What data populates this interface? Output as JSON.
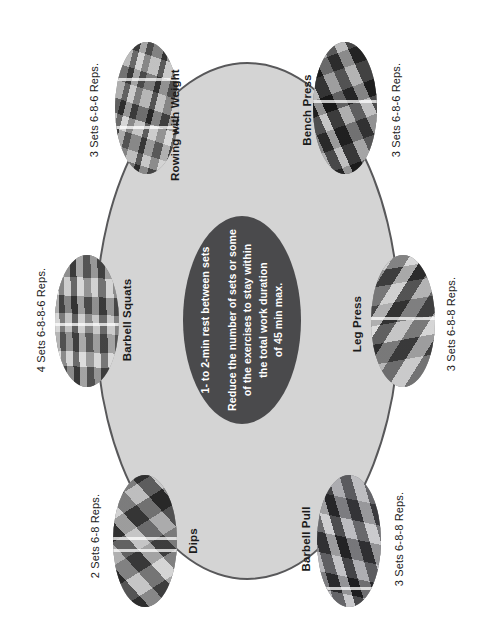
{
  "diagram": {
    "type": "circuit-training-wheel",
    "orientation": "rotated-90-ccw",
    "colors": {
      "outer_ellipse_fill": "#d4d4d4",
      "outer_ellipse_stroke": "#58585a",
      "center_ellipse_fill": "#4a4a4c",
      "center_text": "#ffffff",
      "label_text": "#1b1b1b",
      "page_background": "#ffffff"
    }
  },
  "center_note": {
    "paragraphs": [
      "1- to 2-min rest between sets",
      "Reduce the number of sets or some of the exercises to stay within the total work duration of 45 min max."
    ],
    "line1": "1- to 2-min rest between sets",
    "line2": "Reduce the number of sets or some",
    "line3": "of the exercises to stay within",
    "line4": "the total work duration",
    "line5": "of 45 min max."
  },
  "exercises": [
    {
      "id": "rowing-with-weight",
      "name": "Rowing with Weight",
      "reps": "3 Sets 6-8-6 Reps.",
      "position": "top-left"
    },
    {
      "id": "bench-press",
      "name": "Bench Press",
      "reps": "3 Sets 6-8-6 Reps.",
      "position": "top-right"
    },
    {
      "id": "barbell-squats",
      "name": "Barbell Squats",
      "reps": "4 Sets 6-8-8-6 Reps.",
      "position": "middle-left"
    },
    {
      "id": "leg-press",
      "name": "Leg Press",
      "reps": "3 Sets 6-8-8 Reps.",
      "position": "middle-right"
    },
    {
      "id": "dips",
      "name": "Dips",
      "reps": "2 Sets 6-8 Reps.",
      "position": "bottom-left"
    },
    {
      "id": "barbell-pull",
      "name": "Barbell Pull",
      "reps": "3 Sets 6-8-8 Reps.",
      "position": "bottom-right"
    }
  ]
}
